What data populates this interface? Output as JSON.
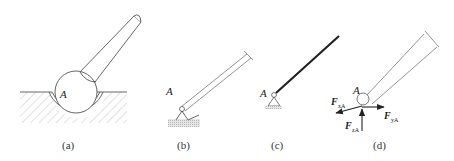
{
  "figure": {
    "panels": [
      {
        "id": "a",
        "caption": "(a)",
        "point_label": "A",
        "description": "ball-and-socket joint: sphere at end of rod sitting in spherical socket in hatched ground"
      },
      {
        "id": "b",
        "caption": "(b)",
        "point_label": "A",
        "description": "inclined rod pinned to a fixed hinge support on hatched ground"
      },
      {
        "id": "c",
        "caption": "(c)",
        "point_label": "A",
        "description": "simplified schematic: thick line member with pin support symbol"
      },
      {
        "id": "d",
        "caption": "(d)",
        "point_label": "A",
        "description": "free-body diagram with three reaction force components at A",
        "forces": [
          {
            "symbol": "F",
            "subscript": "xA",
            "direction": "lower-left"
          },
          {
            "symbol": "F",
            "subscript": "yA",
            "direction": "right"
          },
          {
            "symbol": "F",
            "subscript": "zA",
            "direction": "up"
          }
        ]
      }
    ]
  },
  "colors": {
    "line": "#555555",
    "thick_line": "#222222",
    "hatch": "#bbbbbb",
    "ground_fill": "#d8d8d8"
  }
}
